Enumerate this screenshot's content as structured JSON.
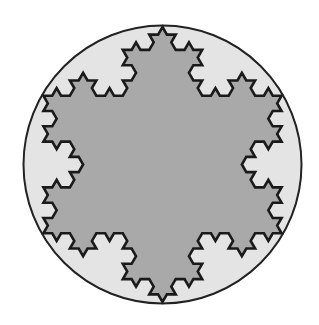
{
  "figure": {
    "type": "koch-snowflake-in-circle",
    "width": 319,
    "height": 325,
    "background": "#ffffff",
    "circle": {
      "cx": 162.5,
      "cy": 164.5,
      "r": 139,
      "fill": "#e4e4e4",
      "stroke": "#222222",
      "stroke_width": 2
    },
    "snowflake": {
      "iterations": 3,
      "circumradius": 137.5,
      "orientation": "tip-up",
      "fill": "#a9a9a9",
      "stroke": "#1a1a1a",
      "stroke_width": 2.6
    }
  }
}
